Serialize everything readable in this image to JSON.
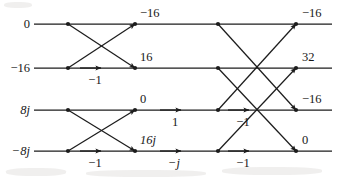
{
  "figure": {
    "kind": "fft-butterfly-signal-flow-graph",
    "stages": 3,
    "rows": 4,
    "line_color": "#1c1c1c",
    "text_color": "#171717",
    "background": "#ffffff"
  },
  "inputs": [
    {
      "value": "0",
      "italic": false
    },
    {
      "value": "−16",
      "italic": false
    },
    {
      "value": "8j",
      "italic": true
    },
    {
      "value": "−8j",
      "italic": true
    }
  ],
  "intermediate": [
    {
      "value": "−16",
      "italic": false
    },
    {
      "value": "16",
      "italic": false
    },
    {
      "value": "0",
      "italic": false
    },
    {
      "value": "16j",
      "italic": true
    }
  ],
  "outputs": [
    {
      "value": "−16",
      "italic": false
    },
    {
      "value": "32",
      "italic": false
    },
    {
      "value": "−16",
      "italic": false
    },
    {
      "value": "0",
      "italic": false
    }
  ],
  "twiddles": {
    "stage1": [
      {
        "label": "−1",
        "italic": false
      },
      {
        "label": "−1",
        "italic": false
      }
    ],
    "stage2": [
      {
        "label": "1",
        "italic": false
      },
      {
        "label": "−j",
        "italic": true
      }
    ],
    "stage3": [
      {
        "label": "−1",
        "italic": false
      },
      {
        "label": "−1",
        "italic": false
      }
    ]
  },
  "geometry": {
    "row_y": [
      24,
      68,
      110,
      151
    ],
    "col_x": [
      68,
      135,
      218,
      296
    ],
    "line_start_x": 34,
    "line_end_x": 332
  }
}
